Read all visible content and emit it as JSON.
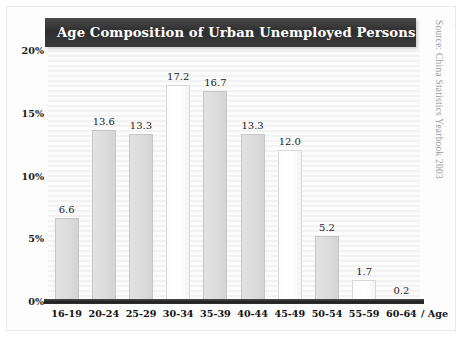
{
  "figure": {
    "title": "Age Composition of Urban Unemployed Persons",
    "year": "2002",
    "source_note": "Source: China Statistics Yearbook 2003",
    "axis_unit_label": "/ Age"
  },
  "chart_data": {
    "type": "bar",
    "title": "Age Composition of Urban Unemployed Persons 2002",
    "subtitle": "",
    "xlabel": "Age",
    "ylabel": "",
    "categories": [
      "16-19",
      "20-24",
      "25-29",
      "30-34",
      "35-39",
      "40-44",
      "45-49",
      "50-54",
      "55-59",
      "60-64"
    ],
    "values": [
      6.6,
      13.6,
      13.3,
      17.2,
      16.7,
      13.3,
      12.0,
      5.2,
      1.7,
      0.2
    ],
    "value_labels": [
      "6.6",
      "13.6",
      "13.3",
      "17.2",
      "16.7",
      "13.3",
      "12.0",
      "5.2",
      "1.7",
      "0.2"
    ],
    "bar_styles": [
      "light",
      "light",
      "light",
      "white",
      "light",
      "light",
      "white",
      "light",
      "white",
      "white"
    ],
    "ylim": [
      0,
      20
    ],
    "ytick_values": [
      0,
      5,
      10,
      15,
      20
    ],
    "ytick_labels": [
      "0%",
      "5%",
      "10%",
      "15%",
      "20%"
    ],
    "grid": false,
    "legend": "none",
    "annotations": [
      "Source: China Statistics Yearbook 2003"
    ],
    "colors": {
      "title_banner": "#2f2f2f",
      "title_text": "#ffffff",
      "bar_light": "#dcdcdc",
      "bar_white": "#ffffff",
      "bar_border": "#c6c6c6",
      "axis_line": "#1d1d1d",
      "plot_background": "#fbfbfb",
      "tick_text": "#111111",
      "source_text": "#9a9a9a"
    }
  }
}
